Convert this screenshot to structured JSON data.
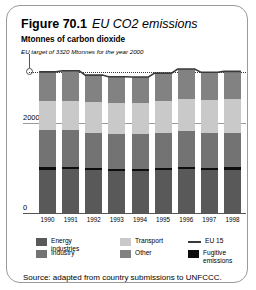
{
  "figure": {
    "label": "Figure 70.1",
    "title": "EU CO2 emissions",
    "axis_title": "Mtonnes of carbon dioxide",
    "target_note": "EU target of 3320 Mtonnes for the year 2000",
    "source": "Source: adapted from country submissions to UNFCCC."
  },
  "chart_data": {
    "type": "bar",
    "title": "EU CO2 emissions",
    "subtitle": "Mtonnes of carbon dioxide",
    "xlabel": "",
    "ylabel": "Mtonnes of carbon dioxide",
    "ylim": [
      0,
      3600
    ],
    "yticks": [
      0,
      2000
    ],
    "ytick_labels": [
      "0",
      "2000"
    ],
    "grid": true,
    "stacked": true,
    "legend_position": "bottom",
    "categories": [
      "1990",
      "1991",
      "1992",
      "1993",
      "1994",
      "1995",
      "1996",
      "1997",
      "1998"
    ],
    "series": [
      {
        "name": "Energy industries",
        "color": "#595959",
        "values": [
          1050,
          1060,
          1030,
          1020,
          1020,
          1030,
          1060,
          1040,
          1050
        ]
      },
      {
        "name": "Fugitive emissions",
        "color": "#0d0d0d",
        "values": [
          60,
          60,
          58,
          55,
          55,
          55,
          55,
          52,
          52
        ]
      },
      {
        "name": "Industry",
        "color": "#737373",
        "values": [
          900,
          880,
          850,
          830,
          840,
          850,
          860,
          850,
          840
        ]
      },
      {
        "name": "Transport",
        "color": "#c9c9c9",
        "values": [
          700,
          715,
          735,
          745,
          755,
          770,
          785,
          800,
          820
        ]
      },
      {
        "name": "Other",
        "color": "#828282",
        "values": [
          700,
          720,
          660,
          640,
          615,
          675,
          720,
          660,
          660
        ]
      }
    ],
    "totals": [
      3410,
      3435,
      3333,
      3290,
      3285,
      3380,
      3480,
      3402,
      3422
    ],
    "annotations": [
      {
        "name": "eu-target",
        "text": "EU target of 3320 Mtonnes for the year 2000",
        "value": 3320,
        "style": "dotted-line-with-circle-marker"
      }
    ],
    "legend": [
      {
        "label": "Energy industries",
        "color": "#595959",
        "marker": "swatch"
      },
      {
        "label": "Industry",
        "color": "#737373",
        "marker": "swatch"
      },
      {
        "label": "Transport",
        "color": "#c9c9c9",
        "marker": "swatch"
      },
      {
        "label": "Other",
        "color": "#828282",
        "marker": "swatch"
      },
      {
        "label": "EU 15",
        "color": "#3a3a3a",
        "marker": "line"
      },
      {
        "label": "Fugitive emissions",
        "color": "#0d0d0d",
        "marker": "swatch"
      }
    ]
  }
}
